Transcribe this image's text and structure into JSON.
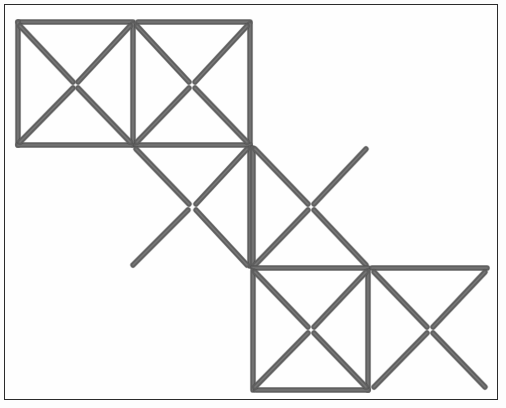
{
  "figure": {
    "canvas": {
      "width": 506,
      "height": 408
    },
    "frame": {
      "name": "outer-border",
      "x": 4,
      "y": 4,
      "width": 494,
      "height": 396,
      "stroke_color": "#2b2b2b",
      "stroke_width": 1.5,
      "fill_color": "#fefefe"
    },
    "style": {
      "stick_color": "#5f5f5f",
      "stick_highlight_color": "#8a8a8a",
      "stick_width": 5,
      "stick_cap": "round",
      "background_color": "#ffffff"
    },
    "grid": {
      "cell_size": 118,
      "columns_x": [
        18,
        133,
        253,
        372,
        487
      ],
      "rows_y": [
        22,
        145,
        268,
        390
      ]
    },
    "counts": {
      "total_matchsticks": 31,
      "cells": 6,
      "diagonals": 12,
      "edges": 19
    },
    "cells": [
      {
        "name": "cell-top-left",
        "x1": 18,
        "y1": 22,
        "x2": 133,
        "y2": 145,
        "edges": [
          "top",
          "left",
          "right",
          "bottom"
        ],
        "diagonals": [
          "tl-br",
          "tr-bl"
        ]
      },
      {
        "name": "cell-top-right",
        "x1": 133,
        "y1": 22,
        "x2": 250,
        "y2": 145,
        "edges": [
          "top",
          "left",
          "right",
          "bottom"
        ],
        "diagonals": [
          "tl-br",
          "tr-bl"
        ]
      },
      {
        "name": "cell-middle-upper",
        "x1": 133,
        "y1": 145,
        "x2": 250,
        "y2": 268,
        "edges": [
          "top",
          "right"
        ],
        "diagonals": [
          "tl-br",
          "tr-bl"
        ]
      },
      {
        "name": "cell-middle-lower",
        "x1": 253,
        "y1": 145,
        "x2": 368,
        "y2": 268,
        "edges": [
          "left",
          "bottom"
        ],
        "diagonals": [
          "tl-br",
          "tr-bl"
        ]
      },
      {
        "name": "cell-bottom-left",
        "x1": 253,
        "y1": 268,
        "x2": 368,
        "y2": 390,
        "edges": [
          "top",
          "left",
          "right",
          "bottom"
        ],
        "diagonals": [
          "tl-br",
          "tr-bl"
        ]
      },
      {
        "name": "cell-bottom-right",
        "x1": 372,
        "y1": 268,
        "x2": 487,
        "y2": 390,
        "edges": [
          "top",
          "left"
        ],
        "diagonals": [
          "tl-br",
          "tr-bl"
        ]
      }
    ],
    "sticks": [
      {
        "name": "stick-01",
        "x1": 18,
        "y1": 22,
        "x2": 133,
        "y2": 22,
        "role": "edge-horizontal"
      },
      {
        "name": "stick-02",
        "x1": 138,
        "y1": 22,
        "x2": 250,
        "y2": 22,
        "role": "edge-horizontal"
      },
      {
        "name": "stick-03",
        "x1": 18,
        "y1": 22,
        "x2": 18,
        "y2": 145,
        "role": "edge-vertical"
      },
      {
        "name": "stick-04",
        "x1": 133,
        "y1": 24,
        "x2": 133,
        "y2": 145,
        "role": "edge-vertical"
      },
      {
        "name": "stick-05",
        "x1": 250,
        "y1": 24,
        "x2": 250,
        "y2": 145,
        "role": "edge-vertical"
      },
      {
        "name": "stick-06",
        "x1": 18,
        "y1": 145,
        "x2": 131,
        "y2": 145,
        "role": "edge-horizontal"
      },
      {
        "name": "stick-07",
        "x1": 136,
        "y1": 145,
        "x2": 250,
        "y2": 145,
        "role": "edge-horizontal"
      },
      {
        "name": "stick-08",
        "x1": 20,
        "y1": 26,
        "x2": 73,
        "y2": 82,
        "role": "diagonal"
      },
      {
        "name": "stick-09",
        "x1": 130,
        "y1": 26,
        "x2": 78,
        "y2": 82,
        "role": "diagonal"
      },
      {
        "name": "stick-10",
        "x1": 20,
        "y1": 142,
        "x2": 73,
        "y2": 88,
        "role": "diagonal"
      },
      {
        "name": "stick-11",
        "x1": 130,
        "y1": 142,
        "x2": 78,
        "y2": 88,
        "role": "diagonal"
      },
      {
        "name": "stick-12",
        "x1": 137,
        "y1": 26,
        "x2": 189,
        "y2": 82,
        "role": "diagonal"
      },
      {
        "name": "stick-13",
        "x1": 247,
        "y1": 26,
        "x2": 195,
        "y2": 82,
        "role": "diagonal"
      },
      {
        "name": "stick-14",
        "x1": 137,
        "y1": 142,
        "x2": 189,
        "y2": 88,
        "role": "diagonal"
      },
      {
        "name": "stick-15",
        "x1": 247,
        "y1": 142,
        "x2": 195,
        "y2": 88,
        "role": "diagonal"
      },
      {
        "name": "stick-16",
        "x1": 250,
        "y1": 148,
        "x2": 250,
        "y2": 266,
        "role": "edge-vertical"
      },
      {
        "name": "stick-17",
        "x1": 136,
        "y1": 149,
        "x2": 189,
        "y2": 204,
        "role": "diagonal"
      },
      {
        "name": "stick-18",
        "x1": 247,
        "y1": 149,
        "x2": 196,
        "y2": 204,
        "role": "diagonal"
      },
      {
        "name": "stick-19",
        "x1": 133,
        "y1": 265,
        "x2": 188,
        "y2": 210,
        "role": "diagonal"
      },
      {
        "name": "stick-20",
        "x1": 247,
        "y1": 265,
        "x2": 196,
        "y2": 210,
        "role": "diagonal"
      },
      {
        "name": "stick-21",
        "x1": 253,
        "y1": 148,
        "x2": 253,
        "y2": 266,
        "role": "edge-vertical"
      },
      {
        "name": "stick-22",
        "x1": 255,
        "y1": 149,
        "x2": 308,
        "y2": 204,
        "role": "diagonal"
      },
      {
        "name": "stick-23",
        "x1": 366,
        "y1": 149,
        "x2": 314,
        "y2": 204,
        "role": "diagonal"
      },
      {
        "name": "stick-24",
        "x1": 255,
        "y1": 265,
        "x2": 308,
        "y2": 210,
        "role": "diagonal"
      },
      {
        "name": "stick-25",
        "x1": 366,
        "y1": 265,
        "x2": 314,
        "y2": 210,
        "role": "diagonal"
      },
      {
        "name": "stick-26",
        "x1": 253,
        "y1": 268,
        "x2": 368,
        "y2": 268,
        "role": "edge-horizontal"
      },
      {
        "name": "stick-27",
        "x1": 372,
        "y1": 268,
        "x2": 487,
        "y2": 268,
        "role": "edge-horizontal"
      },
      {
        "name": "stick-28",
        "x1": 253,
        "y1": 271,
        "x2": 253,
        "y2": 390,
        "role": "edge-vertical"
      },
      {
        "name": "stick-29",
        "x1": 368,
        "y1": 271,
        "x2": 368,
        "y2": 390,
        "role": "edge-vertical"
      },
      {
        "name": "stick-30",
        "x1": 256,
        "y1": 390,
        "x2": 368,
        "y2": 390,
        "role": "edge-horizontal"
      },
      {
        "name": "stick-31",
        "x1": 255,
        "y1": 272,
        "x2": 308,
        "y2": 327,
        "role": "diagonal"
      },
      {
        "name": "stick-32",
        "x1": 366,
        "y1": 272,
        "x2": 314,
        "y2": 327,
        "role": "diagonal"
      },
      {
        "name": "stick-33",
        "x1": 255,
        "y1": 387,
        "x2": 308,
        "y2": 333,
        "role": "diagonal"
      },
      {
        "name": "stick-34",
        "x1": 366,
        "y1": 387,
        "x2": 314,
        "y2": 333,
        "role": "diagonal"
      },
      {
        "name": "stick-35",
        "x1": 374,
        "y1": 272,
        "x2": 427,
        "y2": 327,
        "role": "diagonal"
      },
      {
        "name": "stick-36",
        "x1": 485,
        "y1": 272,
        "x2": 433,
        "y2": 327,
        "role": "diagonal"
      },
      {
        "name": "stick-37",
        "x1": 374,
        "y1": 387,
        "x2": 427,
        "y2": 333,
        "role": "diagonal"
      },
      {
        "name": "stick-38",
        "x1": 485,
        "y1": 387,
        "x2": 433,
        "y2": 333,
        "role": "diagonal"
      }
    ]
  }
}
